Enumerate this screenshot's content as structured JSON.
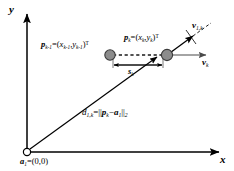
{
  "figure": {
    "background_color": "#ffffff",
    "ink_color": "#000000",
    "marker_fill": "#8c8c8c",
    "marker_stroke": "#3a3a3a",
    "width": 234,
    "height": 171
  },
  "axes": {
    "y_label": "y",
    "x_label": "x",
    "origin_marker": "open-circle"
  },
  "anchor": {
    "label_symbol": "a",
    "label_sub": "1",
    "label_equals": "=(0,0)",
    "full_text": "a1=(0,0)"
  },
  "points": [
    {
      "id": "p-k-minus-1",
      "symbol": "p",
      "sub": "k-1",
      "equals": "=(",
      "coord_x_symbol": "x",
      "coord_x_sub": "k-1",
      "comma": ",",
      "coord_y_symbol": "y",
      "coord_y_sub": "k-1",
      "close": ")",
      "transpose": "T",
      "full_text": "pk-1=(xk-1,yk-1)T"
    },
    {
      "id": "p-k",
      "symbol": "p",
      "sub": "k",
      "equals": "=(",
      "coord_x_symbol": "x",
      "coord_x_sub": "k",
      "comma": ",",
      "coord_y_symbol": "y",
      "coord_y_sub": "k",
      "close": ")",
      "transpose": "T",
      "full_text": "pk=(xk,yk)T"
    }
  ],
  "vectors": [
    {
      "id": "v-1-k",
      "symbol": "v",
      "sub": "1,k",
      "full_text": "v1,k",
      "style": "radial-projection"
    },
    {
      "id": "v-k",
      "symbol": "v",
      "sub": "k",
      "full_text": "vk",
      "style": "velocity"
    }
  ],
  "segment": {
    "id": "s-k",
    "symbol": "s",
    "sub": "k",
    "full_text": "sk"
  },
  "distance": {
    "id": "d-1-k",
    "symbol": "d",
    "sub": "1,k",
    "equals": "=||",
    "term_a": "p",
    "term_a_sub": "k",
    "minus": "−",
    "term_b": "a",
    "term_b_sub": "1",
    "norm_close": "||",
    "norm_sub": "2",
    "full_text": "d1,k=||pk−a1||2"
  }
}
